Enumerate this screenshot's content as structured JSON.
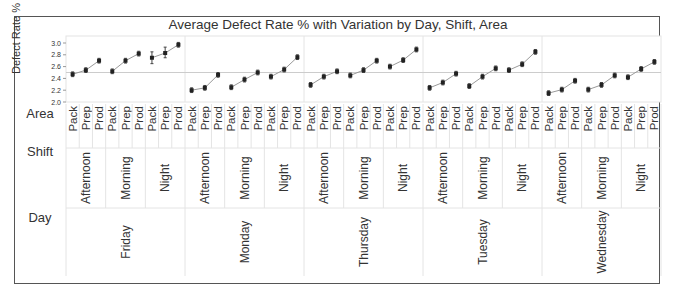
{
  "chart_data": {
    "type": "line",
    "subtype": "variability-chart",
    "title": "Average Defect Rate % with Variation by Day, Shift, Area",
    "ylabel": "Defect Rate %",
    "ylim": [
      2.0,
      3.05
    ],
    "yticks": [
      "2.0",
      "2.2",
      "2.4",
      "2.6",
      "2.8",
      "3.0"
    ],
    "reference_line": 2.5,
    "grid": true,
    "row_headers": [
      "Area",
      "Shift",
      "Day"
    ],
    "days": [
      "Friday",
      "Monday",
      "Thursday",
      "Tuesday",
      "Wednesday"
    ],
    "shifts": [
      "Afternoon",
      "Morning",
      "Night"
    ],
    "areas": [
      "Pack",
      "Prep",
      "Prod"
    ],
    "series": [
      {
        "day": "Friday",
        "shift": "Afternoon",
        "values": [
          2.47,
          2.54,
          2.7
        ]
      },
      {
        "day": "Friday",
        "shift": "Morning",
        "values": [
          2.52,
          2.7,
          2.82
        ]
      },
      {
        "day": "Friday",
        "shift": "Night",
        "values": [
          2.75,
          2.83,
          2.97
        ]
      },
      {
        "day": "Monday",
        "shift": "Afternoon",
        "values": [
          2.2,
          2.24,
          2.46
        ]
      },
      {
        "day": "Monday",
        "shift": "Morning",
        "values": [
          2.25,
          2.38,
          2.5
        ]
      },
      {
        "day": "Monday",
        "shift": "Night",
        "values": [
          2.43,
          2.55,
          2.76
        ]
      },
      {
        "day": "Thursday",
        "shift": "Afternoon",
        "values": [
          2.29,
          2.43,
          2.52
        ]
      },
      {
        "day": "Thursday",
        "shift": "Morning",
        "values": [
          2.45,
          2.54,
          2.7
        ]
      },
      {
        "day": "Thursday",
        "shift": "Night",
        "values": [
          2.6,
          2.71,
          2.89
        ]
      },
      {
        "day": "Tuesday",
        "shift": "Afternoon",
        "values": [
          2.24,
          2.33,
          2.48
        ]
      },
      {
        "day": "Tuesday",
        "shift": "Morning",
        "values": [
          2.27,
          2.43,
          2.57
        ]
      },
      {
        "day": "Tuesday",
        "shift": "Night",
        "values": [
          2.54,
          2.64,
          2.85
        ]
      },
      {
        "day": "Wednesday",
        "shift": "Afternoon",
        "values": [
          2.15,
          2.21,
          2.36
        ]
      },
      {
        "day": "Wednesday",
        "shift": "Morning",
        "values": [
          2.21,
          2.29,
          2.45
        ]
      },
      {
        "day": "Wednesday",
        "shift": "Night",
        "values": [
          2.42,
          2.56,
          2.68
        ]
      }
    ],
    "error_ranges": {
      "Friday-Night-Pack": [
        2.65,
        2.85
      ],
      "Friday-Night-Prep": [
        2.75,
        2.93
      ]
    }
  },
  "colors": {
    "point": "#222222",
    "line": "#999999",
    "grid": "#e4e4e4",
    "refline": "#cccccc",
    "text": "#333333"
  }
}
